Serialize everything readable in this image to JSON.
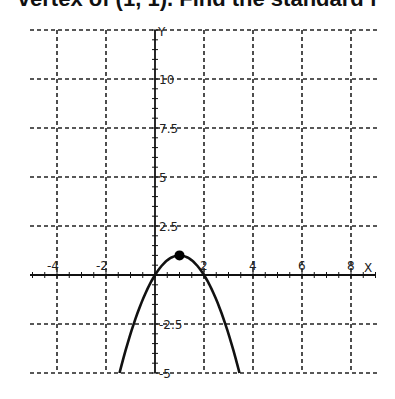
{
  "header": {
    "text": "vertex of (1, 1). Find the standard f"
  },
  "chart_data": {
    "type": "line",
    "title": "",
    "xlabel": "X",
    "ylabel": "Y",
    "xlim": [
      -5.1,
      9.2
    ],
    "ylim": [
      -5,
      12.5
    ],
    "grid": true,
    "x_ticks": [
      -4,
      -2,
      2,
      4,
      6,
      8
    ],
    "x_tick_labels": [
      "-4",
      "-2",
      "2",
      "4",
      "6",
      "8"
    ],
    "y_ticks": [
      10,
      7.5,
      5,
      2.5,
      -2.5,
      -5
    ],
    "y_tick_labels": [
      "10",
      "7.5",
      "5",
      "2.5",
      "-2.5",
      "-5"
    ],
    "series": [
      {
        "name": "parabola",
        "equation": "y = -(x-1)^2 + 1",
        "x": [
          -1.45,
          -1,
          -0.5,
          0,
          0.5,
          1,
          1.5,
          2,
          2.5,
          3,
          3.45
        ],
        "y": [
          -5,
          -3,
          -1.25,
          0,
          0.75,
          1,
          0.75,
          0,
          -1.25,
          -3,
          -5
        ]
      }
    ],
    "points": [
      {
        "label": "vertex",
        "x": 1,
        "y": 1
      }
    ],
    "legend": null
  }
}
